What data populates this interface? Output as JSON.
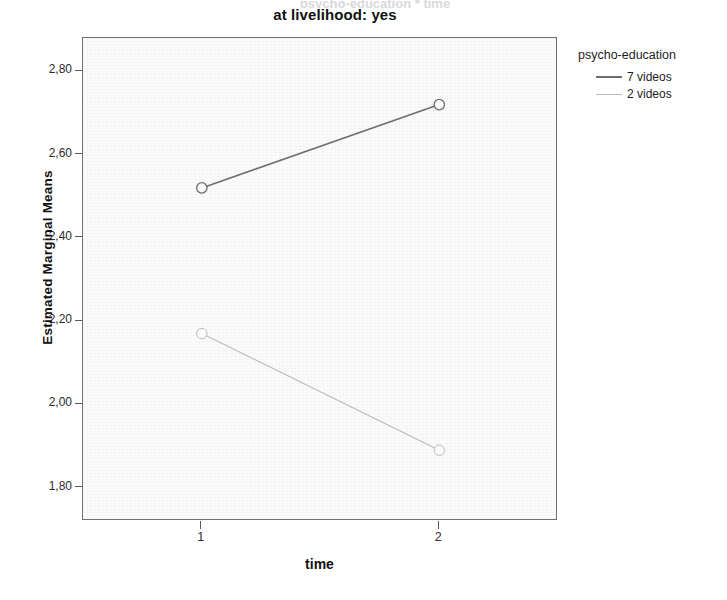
{
  "header": {
    "clipped_text": "psycho-education * time",
    "title": "at livelihood: yes"
  },
  "axes": {
    "x_title": "time",
    "y_title": "Estimated Marginal Means",
    "y_ticks": [
      "2,80",
      "2,60",
      "2,40",
      "2,20",
      "2,00",
      "1,80"
    ],
    "x_ticks": [
      "1",
      "2"
    ]
  },
  "legend": {
    "title": "psycho-education",
    "entries": [
      {
        "label": "7 videos",
        "color": "#6d6e71"
      },
      {
        "label": "2 videos",
        "color": "#b9babd"
      }
    ]
  },
  "chart_data": {
    "type": "line",
    "title": "at livelihood: yes",
    "xlabel": "time",
    "ylabel": "Estimated Marginal Means",
    "categories": [
      "1",
      "2"
    ],
    "x": [
      1,
      2
    ],
    "xlim": [
      0.5,
      2.5
    ],
    "ylim": [
      1.72,
      2.88
    ],
    "ytick_values": [
      2.8,
      2.6,
      2.4,
      2.2,
      2.0,
      1.8
    ],
    "grid": false,
    "legend_position": "right",
    "legend_title": "psycho-education",
    "marker": "open-circle",
    "series": [
      {
        "name": "7 videos",
        "values": [
          2.52,
          2.72
        ],
        "color": "#6d6e71",
        "width": 1.6
      },
      {
        "name": "2 videos",
        "values": [
          2.17,
          1.89
        ],
        "color": "#b9babd",
        "width": 1.1
      }
    ]
  }
}
